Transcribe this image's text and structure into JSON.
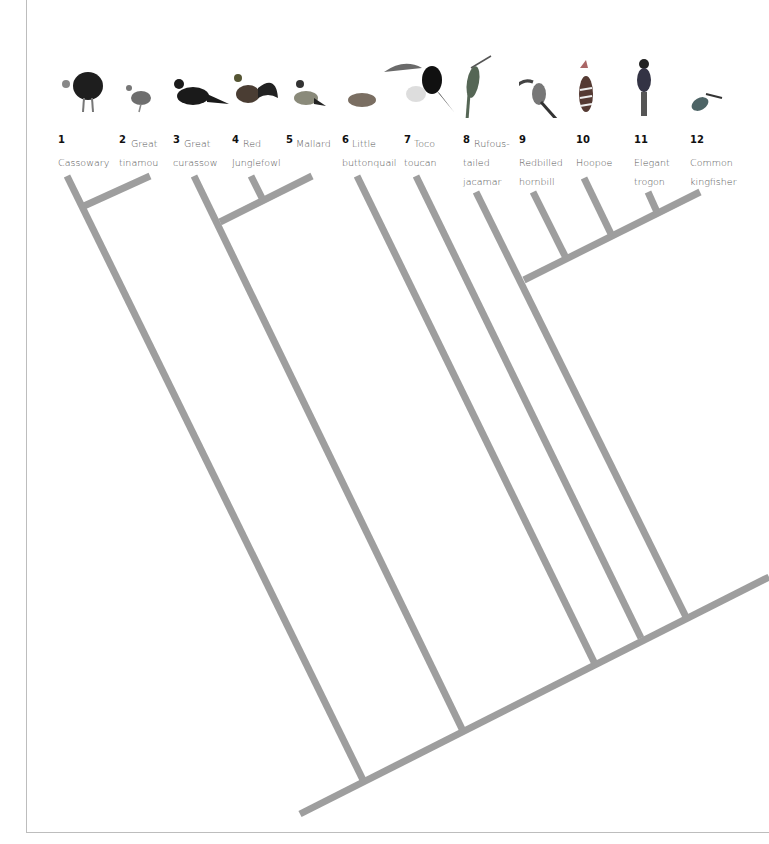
{
  "diagram": {
    "type": "cladogram",
    "line_color": "#9e9e9e",
    "taxa": [
      {
        "num": "1",
        "name_line1": "",
        "name_line2": "Cassowary",
        "name_line3": ""
      },
      {
        "num": "2",
        "name_line1": "Great",
        "name_line2": "tinamou",
        "name_line3": ""
      },
      {
        "num": "3",
        "name_line1": "Great",
        "name_line2": "curassow",
        "name_line3": ""
      },
      {
        "num": "4",
        "name_line1": "Red",
        "name_line2": "Junglefowl",
        "name_line3": ""
      },
      {
        "num": "5",
        "name_line1": "Mallard",
        "name_line2": "",
        "name_line3": ""
      },
      {
        "num": "6",
        "name_line1": "Little",
        "name_line2": "buttonquail",
        "name_line3": ""
      },
      {
        "num": "7",
        "name_line1": "Toco",
        "name_line2": "toucan",
        "name_line3": ""
      },
      {
        "num": "8",
        "name_line1": "Rufous-",
        "name_line2": "tailed",
        "name_line3": "jacamar"
      },
      {
        "num": "9",
        "name_line1": "",
        "name_line2": "Redbilled",
        "name_line3": "hornbill"
      },
      {
        "num": "10",
        "name_line1": "",
        "name_line2": "Hoopoe",
        "name_line3": ""
      },
      {
        "num": "11",
        "name_line1": "",
        "name_line2": "Elegant",
        "name_line3": "trogon"
      },
      {
        "num": "12",
        "name_line1": "",
        "name_line2": "Common",
        "name_line3": "kingfisher"
      }
    ],
    "icons": [
      "cassowary-icon",
      "tinamou-icon",
      "curassow-icon",
      "junglefowl-icon",
      "mallard-icon",
      "buttonquail-icon",
      "toucan-icon",
      "jacamar-icon",
      "hornbill-icon",
      "hoopoe-icon",
      "trogon-icon",
      "kingfisher-icon"
    ]
  }
}
